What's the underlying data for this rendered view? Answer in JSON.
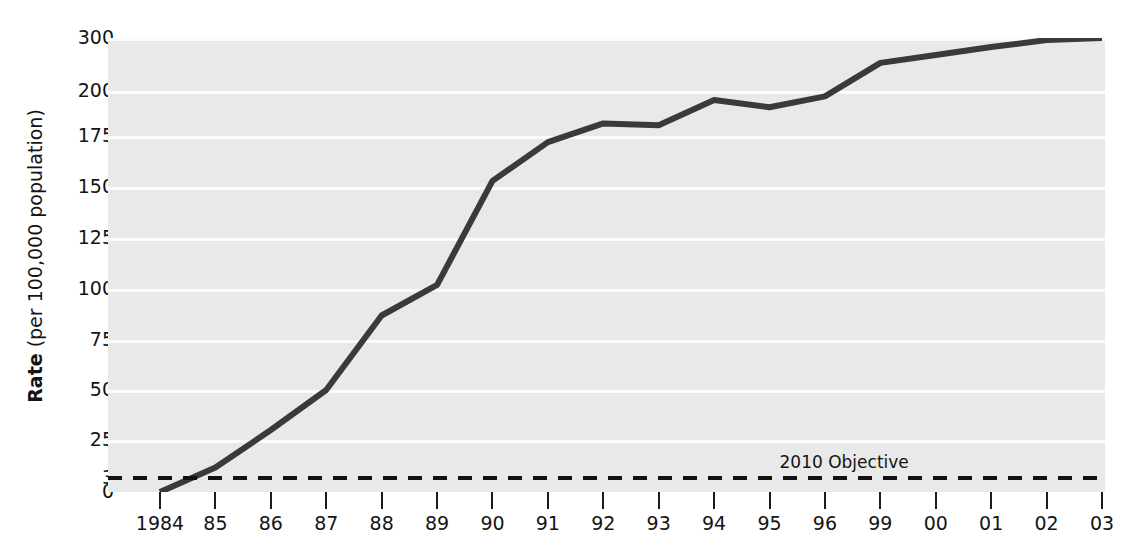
{
  "chart_data": {
    "type": "line",
    "title": "",
    "xlabel": "",
    "ylabel": "Rate (per 100,000 population)",
    "ylabel_bold_part": "Rate",
    "ylabel_rest": " (per 100,000 population)",
    "categories": [
      "1984",
      "85",
      "86",
      "87",
      "88",
      "89",
      "90",
      "91",
      "92",
      "93",
      "94",
      "95",
      "96",
      "99",
      "00",
      "01",
      "02",
      "03"
    ],
    "values": [
      0,
      9,
      30,
      50,
      87,
      102,
      153,
      172,
      182,
      181,
      195,
      191,
      197,
      253,
      268,
      283,
      296,
      309
    ],
    "yticks": [
      0,
      3,
      25,
      50,
      75,
      100,
      125,
      150,
      175,
      200,
      300
    ],
    "ytick_labels": [
      "0",
      "3",
      "25",
      "50",
      "75",
      "100",
      "125",
      "150",
      "175",
      "200",
      "300"
    ],
    "ylim": [
      0,
      300
    ],
    "grid": true,
    "legend_position": "none",
    "annotations": [
      {
        "text": "2010 Objective",
        "value": 3,
        "style": "dashed-reference-line"
      }
    ],
    "series": [
      {
        "name": "Rate",
        "color": "#3a3a3a"
      }
    ],
    "colors": {
      "line": "#3a3a3a",
      "plot_background": "#e9e9e9",
      "gridline": "#fbfbfb",
      "objective_line": "#111111",
      "text": "#141414",
      "page_background": "#ffffff"
    }
  }
}
